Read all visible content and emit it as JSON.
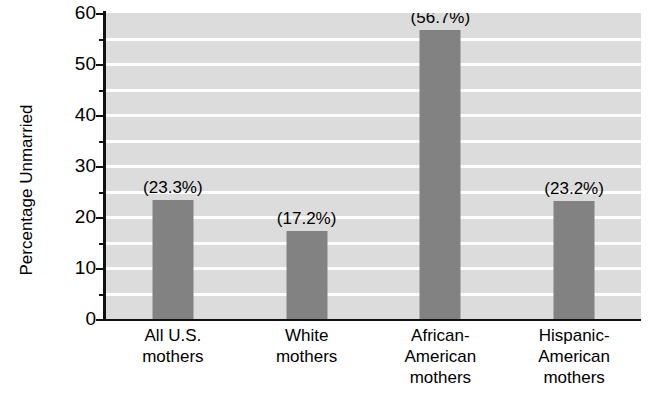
{
  "chart_data": {
    "type": "bar",
    "title": "",
    "xlabel": "",
    "ylabel": "Percentage Unmarried",
    "ylim": [
      0,
      60
    ],
    "ytick_values": [
      0,
      10,
      20,
      30,
      40,
      50,
      60
    ],
    "ytick_labels": [
      "0",
      "10",
      "20",
      "30",
      "40",
      "50",
      "60"
    ],
    "minor_tick_values": [
      5,
      15,
      25,
      35,
      45,
      55
    ],
    "gridlines": [
      5,
      10,
      15,
      20,
      25,
      30,
      35,
      40,
      45,
      50,
      55
    ],
    "grid": true,
    "legend": "none",
    "categories": [
      "All U.S. mothers",
      "White mothers",
      "African-American mothers",
      "Hispanic-American mothers"
    ],
    "category_lines": [
      [
        "All U.S.",
        "mothers"
      ],
      [
        "White",
        "mothers"
      ],
      [
        "African-",
        "American",
        "mothers"
      ],
      [
        "Hispanic-",
        "American",
        "mothers"
      ]
    ],
    "values": [
      23.3,
      17.2,
      56.7,
      23.2
    ],
    "data_labels": [
      "(23.3%)",
      "(17.2%)",
      "(56.7%)",
      "(23.2%)"
    ],
    "colors": {
      "bar": "#828282",
      "plot_background": "#dcdcdc",
      "gridline": "#fdfdfd",
      "axis": "#111111",
      "page_background": "#ffffff",
      "text": "#000000"
    }
  }
}
